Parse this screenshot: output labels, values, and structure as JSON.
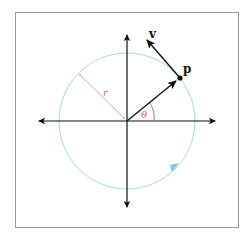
{
  "diagram": {
    "type": "circular-motion",
    "labels": {
      "point": "p",
      "velocity": "v",
      "radius": "r",
      "angle": "θ"
    },
    "colors": {
      "axes": "#111111",
      "circle": "#a8dbe8",
      "radius_line": "#e8a0a0",
      "angle": "#d46a6a",
      "vectors": "#111111",
      "direction_arrow": "#7ec8e3",
      "frame": "#9a9a9a"
    },
    "geometry": {
      "origin": [
        127,
        121
      ],
      "circle_radius": 68,
      "point_p": [
        180,
        78
      ],
      "velocity_tip": [
        145,
        38
      ],
      "angle_deg": 39
    },
    "icons": {
      "direction": "arrowhead-icon"
    }
  }
}
